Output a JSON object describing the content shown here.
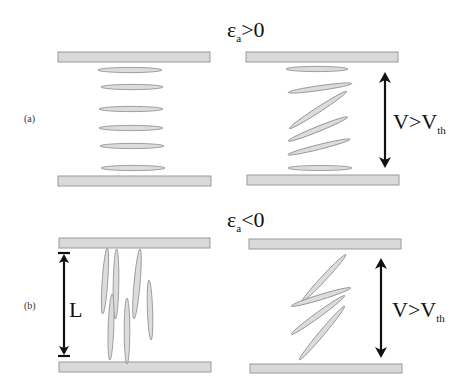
{
  "figure": {
    "panel_a": {
      "tag": "(a)",
      "title_symbol": "ε",
      "title_subscript": "a",
      "title_relation": ">0",
      "voltage_label": "V>V",
      "voltage_subscript": "th"
    },
    "panel_b": {
      "tag": "(b)",
      "title_symbol": "ε",
      "title_subscript": "a",
      "title_relation": "<0",
      "thickness_label": "L",
      "voltage_label": "V>V",
      "voltage_subscript": "th"
    }
  },
  "colors": {
    "plate_fill": "#d9d9d9",
    "molecule_fill": "#dcdcdc",
    "arrow": "#111111"
  }
}
